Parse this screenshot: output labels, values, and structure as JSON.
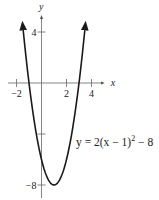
{
  "chart_data": {
    "type": "line",
    "title": "",
    "xlabel": "x",
    "ylabel": "y",
    "xlim": [
      -2.5,
      5
    ],
    "ylim": [
      -8.5,
      5
    ],
    "grid": false,
    "x_ticks": [
      {
        "value": -2,
        "label": "-2"
      },
      {
        "value": 2,
        "label": "2"
      },
      {
        "value": 4,
        "label": "4"
      }
    ],
    "y_ticks": [
      {
        "value": 4,
        "label": "4"
      },
      {
        "value": -4,
        "label": ""
      },
      {
        "value": -8,
        "label": "-8"
      }
    ],
    "series": [
      {
        "name": "parabola",
        "function": "2*(x-1)^2-8",
        "x_range": [
          -1.5,
          3.5
        ],
        "vertex": [
          1,
          -8
        ],
        "color": "#1a1a1a"
      }
    ],
    "annotations": [
      {
        "text_main": "y = 2(x − 1)",
        "superscript": "2",
        "text_tail": " − 8",
        "position": "right"
      }
    ]
  }
}
